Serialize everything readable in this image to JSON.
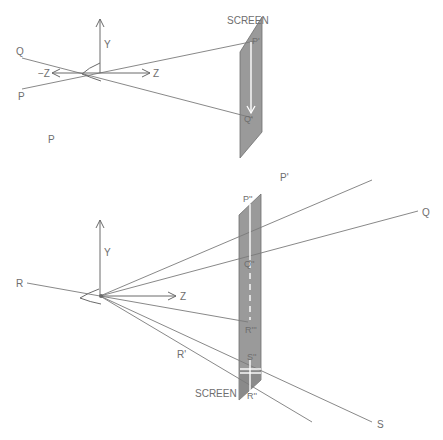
{
  "top_diagram": {
    "screen_label": "SCREEN",
    "axis_y_label": "Y",
    "axis_z_label": "Z",
    "axis_neg_z_label": "−Z",
    "point_q_label": "Q",
    "point_p_label": "P",
    "image_p_label": "P'",
    "image_q_label": "Q'"
  },
  "stray_label": "P",
  "bottom_diagram": {
    "screen_label": "SCREEN",
    "axis_y_label": "Y",
    "axis_z_label": "Z",
    "point_r_label": "R",
    "point_p_label": "P'",
    "point_q_label": "Q",
    "point_s_label": "S",
    "point_r_prime_label": "R'",
    "image_p_label": "P''",
    "image_q_label": "Q''",
    "image_r_label": "R'''",
    "image_s_label": "S''",
    "image_r2_label": "R''"
  },
  "colors": {
    "line": "#7a7a7a",
    "screen_fill": "#9a9a9a",
    "label": "#6e6e6e",
    "background": "#ffffff"
  }
}
